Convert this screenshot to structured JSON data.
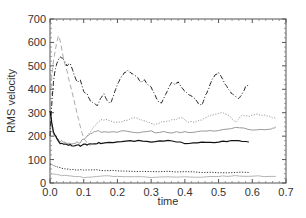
{
  "chart_data": {
    "type": "line",
    "title": "",
    "xlabel": "time",
    "ylabel": "RMS velocity",
    "xlim": [
      0.0,
      0.7
    ],
    "ylim": [
      0,
      700
    ],
    "xticks": [
      "0.0",
      "0.1",
      "0.2",
      "0.3",
      "0.4",
      "0.5",
      "0.6",
      "0.7"
    ],
    "yticks": [
      "0",
      "100",
      "200",
      "300",
      "400",
      "500",
      "600",
      "700"
    ],
    "grid": false,
    "legend": "none",
    "series": [
      {
        "name": "dark dash-dot (upper)",
        "style": "dashdot",
        "color": "#222222",
        "x": [
          0.0,
          0.005,
          0.01,
          0.015,
          0.02,
          0.03,
          0.04,
          0.05,
          0.06,
          0.07,
          0.08,
          0.09,
          0.1,
          0.11,
          0.12,
          0.13,
          0.14,
          0.15,
          0.16,
          0.17,
          0.18,
          0.19,
          0.2,
          0.21,
          0.22,
          0.23,
          0.24,
          0.25,
          0.26,
          0.27,
          0.28,
          0.29,
          0.3,
          0.31,
          0.32,
          0.33,
          0.34,
          0.35,
          0.36,
          0.37,
          0.38,
          0.39,
          0.4,
          0.41,
          0.42,
          0.43,
          0.44,
          0.45,
          0.46,
          0.47,
          0.48,
          0.49,
          0.5,
          0.51,
          0.52,
          0.53,
          0.54,
          0.55,
          0.56,
          0.57,
          0.58,
          0.59
        ],
        "values": [
          200,
          330,
          430,
          480,
          510,
          540,
          530,
          500,
          510,
          470,
          430,
          440,
          390,
          380,
          350,
          340,
          330,
          360,
          380,
          350,
          340,
          380,
          420,
          450,
          470,
          480,
          470,
          460,
          450,
          430,
          440,
          420,
          410,
          380,
          350,
          340,
          370,
          400,
          430,
          420,
          430,
          410,
          390,
          380,
          370,
          360,
          340,
          330,
          370,
          400,
          440,
          460,
          470,
          450,
          420,
          400,
          380,
          370,
          360,
          380,
          410,
          420
        ]
      },
      {
        "name": "light dashed (peak)",
        "style": "dashed",
        "color": "#aaaaaa",
        "x": [
          0.0,
          0.005,
          0.01,
          0.015,
          0.02,
          0.025,
          0.03,
          0.035,
          0.04,
          0.05,
          0.06,
          0.07,
          0.08,
          0.09,
          0.1,
          0.11,
          0.12
        ],
        "values": [
          300,
          450,
          520,
          560,
          600,
          630,
          610,
          570,
          530,
          480,
          420,
          360,
          300,
          240,
          190,
          170,
          160
        ]
      },
      {
        "name": "light dotted (upper-mid)",
        "style": "dotted",
        "color": "#999999",
        "x": [
          0.11,
          0.13,
          0.15,
          0.17,
          0.19,
          0.21,
          0.23,
          0.25,
          0.27,
          0.29,
          0.31,
          0.33,
          0.35,
          0.37,
          0.39,
          0.41,
          0.43,
          0.45,
          0.47,
          0.49,
          0.51,
          0.53,
          0.55,
          0.57,
          0.59,
          0.61,
          0.63,
          0.65,
          0.67
        ],
        "values": [
          200,
          240,
          270,
          270,
          260,
          260,
          270,
          280,
          270,
          260,
          250,
          260,
          265,
          270,
          280,
          260,
          260,
          270,
          285,
          295,
          300,
          290,
          260,
          290,
          285,
          295,
          290,
          285,
          275
        ]
      },
      {
        "name": "gray noisy (mid)",
        "style": "solid-noisy",
        "color": "#9a9a9a",
        "x": [
          0.0,
          0.01,
          0.02,
          0.03,
          0.05,
          0.07,
          0.09,
          0.11,
          0.13,
          0.15,
          0.2,
          0.25,
          0.3,
          0.35,
          0.4,
          0.45,
          0.5,
          0.55,
          0.6,
          0.65,
          0.67
        ],
        "values": [
          300,
          210,
          190,
          180,
          170,
          170,
          175,
          200,
          215,
          220,
          220,
          215,
          220,
          215,
          215,
          220,
          225,
          235,
          225,
          230,
          240
        ]
      },
      {
        "name": "black solid (lower-mid)",
        "style": "solid",
        "color": "#111111",
        "x": [
          0.0,
          0.005,
          0.01,
          0.02,
          0.03,
          0.05,
          0.07,
          0.09,
          0.11,
          0.13,
          0.15,
          0.2,
          0.25,
          0.3,
          0.35,
          0.4,
          0.45,
          0.5,
          0.55,
          0.59
        ],
        "values": [
          310,
          260,
          220,
          190,
          170,
          165,
          160,
          160,
          165,
          170,
          170,
          175,
          180,
          175,
          180,
          170,
          175,
          175,
          180,
          175
        ]
      },
      {
        "name": "dark dotted (low)",
        "style": "dotted",
        "color": "#333333",
        "x": [
          0.0,
          0.01,
          0.02,
          0.04,
          0.06,
          0.1,
          0.15,
          0.2,
          0.3,
          0.4,
          0.5,
          0.59
        ],
        "values": [
          80,
          75,
          68,
          62,
          58,
          55,
          55,
          52,
          50,
          47,
          45,
          45
        ]
      },
      {
        "name": "light solid (bottom)",
        "style": "solid",
        "color": "#b5b5b5",
        "x": [
          0.0,
          0.02,
          0.05,
          0.1,
          0.15,
          0.2,
          0.3,
          0.4,
          0.5,
          0.55,
          0.6,
          0.67
        ],
        "values": [
          40,
          35,
          30,
          25,
          30,
          28,
          25,
          25,
          28,
          30,
          30,
          28
        ]
      }
    ]
  }
}
